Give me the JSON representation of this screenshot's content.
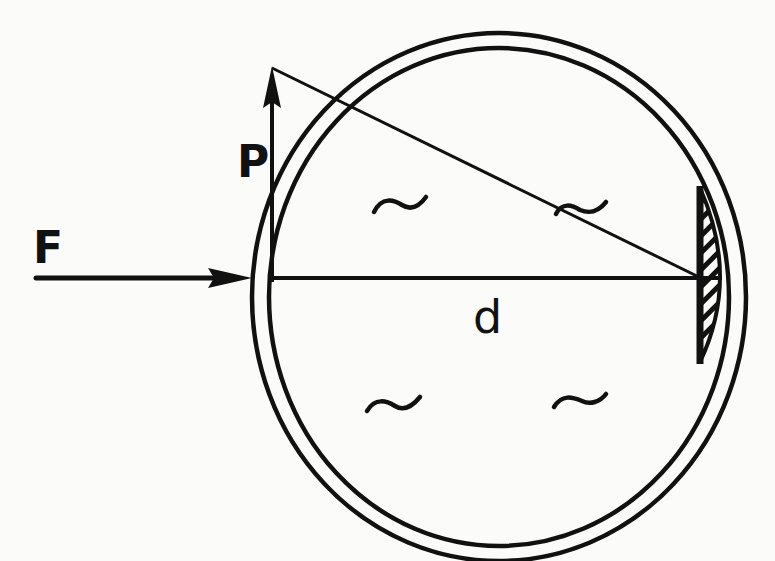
{
  "figure": {
    "type": "schematic diagram",
    "colors": {
      "ink": "#111111",
      "paper": "#fbfbfa"
    },
    "labels": {
      "force": "F",
      "perpendicular": "P",
      "distance": "d"
    },
    "elements": [
      {
        "id": "outer-circle",
        "kind": "circle"
      },
      {
        "id": "inner-circle",
        "kind": "circle"
      },
      {
        "id": "force-arrow",
        "kind": "arrow",
        "label": "F",
        "direction": "right"
      },
      {
        "id": "p-arrow",
        "kind": "arrow",
        "label": "P",
        "direction": "up"
      },
      {
        "id": "diameter-line",
        "kind": "line",
        "label": "d"
      },
      {
        "id": "diagonal-line",
        "kind": "line"
      },
      {
        "id": "hatched-region",
        "kind": "hatched segment",
        "position": "right inner edge"
      },
      {
        "id": "fluid-symbols",
        "kind": "tilde",
        "count": 4
      }
    ],
    "fluid_symbol": "~"
  }
}
